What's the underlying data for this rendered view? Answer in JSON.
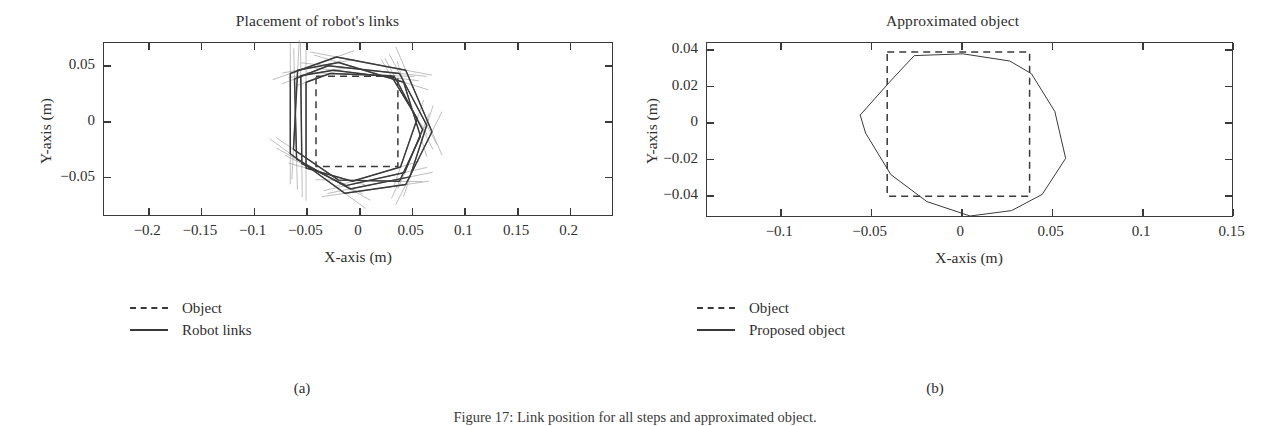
{
  "figure": {
    "caption": "Figure 17: Link position for all steps and approximated object.",
    "subcaptions": [
      {
        "id": "a",
        "label": "(a)"
      },
      {
        "id": "b",
        "label": "(b)"
      }
    ]
  },
  "panels": [
    {
      "id": "a",
      "title": "Placement of robot's links",
      "xlabel": "X-axis (m)",
      "ylabel": "Y-axis (m)",
      "xticks": [
        "-0.2",
        "-0.15",
        "-0.1",
        "-0.05",
        "0",
        "0.05",
        "0.1",
        "0.15",
        "0.2"
      ],
      "yticks": [
        "0.05",
        "0",
        "-0.05"
      ],
      "legend": [
        {
          "label": "Object",
          "style": "dashed"
        },
        {
          "label": "Robot links",
          "style": "solid"
        }
      ]
    },
    {
      "id": "b",
      "title": "Approximated object",
      "xlabel": "X-axis (m)",
      "ylabel": "Y-axis (m)",
      "xticks": [
        "-0.1",
        "-0.05",
        "0",
        "0.05",
        "0.1",
        "0.15"
      ],
      "yticks": [
        "0.04",
        "0.02",
        "0",
        "-0.02",
        "-0.04"
      ],
      "legend": [
        {
          "label": "Object",
          "style": "dashed"
        },
        {
          "label": "Proposed object",
          "style": "solid"
        }
      ]
    }
  ],
  "colors": {
    "axis": "#3a3a3a",
    "line": "#3a3a3a",
    "light_line": "#8a8a8a",
    "text": "#2e2e2e",
    "background": "#ffffff"
  },
  "chart_data": [
    {
      "type": "line",
      "panel": "a",
      "title": "Placement of robot's links",
      "xlabel": "X-axis (m)",
      "ylabel": "Y-axis (m)",
      "xlim": [
        -0.242,
        0.242
      ],
      "ylim": [
        -0.0862,
        0.0702
      ],
      "xticks": [
        -0.2,
        -0.15,
        -0.1,
        -0.05,
        0,
        0.05,
        0.1,
        0.15,
        0.2
      ],
      "yticks": [
        0.05,
        0,
        -0.05
      ],
      "grid": false,
      "legend_position": "below-left",
      "series": [
        {
          "name": "Object",
          "style": "dashed",
          "closed": true,
          "points": [
            [
              -0.04,
              0.04
            ],
            [
              0.038,
              0.04
            ],
            [
              0.038,
              -0.042
            ],
            [
              -0.04,
              -0.042
            ]
          ]
        },
        {
          "name": "Robot links",
          "style": "solid",
          "closed": true,
          "points": [
            [
              -0.0545,
              0.0405
            ],
            [
              -0.0235,
              0.0455
            ],
            [
              0.0355,
              0.0385
            ],
            [
              0.0615,
              -0.0085
            ],
            [
              0.0445,
              -0.0475
            ],
            [
              -0.0115,
              -0.0595
            ],
            [
              -0.0535,
              -0.0395
            ]
          ]
        },
        {
          "name": "Robot links",
          "style": "solid",
          "closed": true,
          "points": [
            [
              -0.0605,
              0.0375
            ],
            [
              -0.0285,
              0.0495
            ],
            [
              0.0395,
              0.0425
            ],
            [
              0.0655,
              -0.0045
            ],
            [
              0.0495,
              -0.0515
            ],
            [
              -0.0075,
              -0.0625
            ],
            [
              -0.0585,
              -0.0355
            ]
          ]
        },
        {
          "name": "Robot links",
          "style": "solid",
          "closed": true,
          "points": [
            [
              -0.0575,
              0.0455
            ],
            [
              -0.0185,
              0.0525
            ],
            [
              0.0435,
              0.0345
            ],
            [
              0.0595,
              -0.0145
            ],
            [
              0.0395,
              -0.0555
            ],
            [
              -0.0185,
              -0.0545
            ],
            [
              -0.0615,
              -0.0265
            ]
          ]
        },
        {
          "name": "Robot links",
          "style": "solid",
          "closed": true,
          "points": [
            [
              -0.0495,
              0.0345
            ],
            [
              -0.0265,
              0.0425
            ],
            [
              0.0315,
              0.0405
            ],
            [
              0.0565,
              0.0015
            ],
            [
              0.0405,
              -0.0425
            ],
            [
              -0.0055,
              -0.0555
            ],
            [
              -0.0495,
              -0.0435
            ]
          ]
        },
        {
          "name": "Robot links",
          "style": "solid",
          "closed": true,
          "points": [
            [
              -0.0645,
              0.0425
            ],
            [
              -0.0205,
              0.0575
            ],
            [
              0.0455,
              0.0455
            ],
            [
              0.0705,
              -0.0105
            ],
            [
              0.0455,
              -0.0585
            ],
            [
              -0.0125,
              -0.0665
            ],
            [
              -0.0645,
              -0.0305
            ]
          ]
        }
      ],
      "annotations": "Multiple overlapping hexagonal robot-link polygons with thin extended link traces surrounding a dashed square object centered near the origin."
    },
    {
      "type": "line",
      "panel": "b",
      "title": "Approximated object",
      "xlabel": "X-axis (m)",
      "ylabel": "Y-axis (m)",
      "xlim": [
        -0.1405,
        0.1508
      ],
      "ylim": [
        -0.0525,
        0.0435
      ],
      "xticks": [
        -0.1,
        -0.05,
        0,
        0.05,
        0.1,
        0.15
      ],
      "yticks": [
        0.04,
        0.02,
        0,
        -0.02,
        -0.04
      ],
      "grid": false,
      "legend_position": "below-left",
      "series": [
        {
          "name": "Object",
          "style": "dashed",
          "closed": true,
          "points": [
            [
              -0.0405,
              0.0385
            ],
            [
              0.0385,
              0.0385
            ],
            [
              0.0385,
              -0.0415
            ],
            [
              -0.0405,
              -0.0415
            ]
          ]
        },
        {
          "name": "Proposed object",
          "style": "solid",
          "closed": true,
          "points": [
            [
              -0.0255,
              0.0365
            ],
            [
              0.0015,
              0.0375
            ],
            [
              0.0275,
              0.0335
            ],
            [
              0.0395,
              0.0265
            ],
            [
              0.0525,
              0.0055
            ],
            [
              0.0585,
              -0.0205
            ],
            [
              0.0455,
              -0.0405
            ],
            [
              0.0285,
              -0.0495
            ],
            [
              0.0055,
              -0.0525
            ],
            [
              -0.0185,
              -0.0445
            ],
            [
              -0.0385,
              -0.0295
            ],
            [
              -0.0525,
              -0.0065
            ],
            [
              -0.0555,
              0.0035
            ],
            [
              -0.0395,
              0.0215
            ]
          ]
        }
      ],
      "annotations": "A rounded hexagonal approximation polygon encloses and overlaps the dashed rectangular object outline."
    }
  ]
}
